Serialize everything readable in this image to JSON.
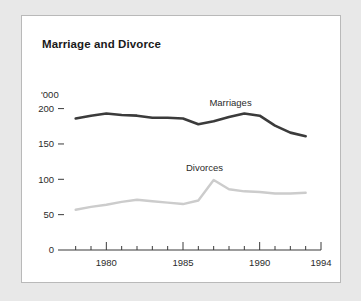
{
  "figure": {
    "title": "Marriage and Divorce",
    "background_color": "#e8e8e8",
    "panel_color": "#ffffff",
    "border_color": "#b9b9b9"
  },
  "chart_data": {
    "type": "line",
    "title": "Marriage and Divorce",
    "xlabel": "",
    "ylabel": "'000",
    "unit_label": "'000",
    "xlim": [
      1977.5,
      1994
    ],
    "ylim": [
      0,
      215
    ],
    "ytick_values": [
      0,
      50,
      100,
      150,
      200
    ],
    "ytick_labels": [
      "0",
      "50",
      "100",
      "150",
      "200"
    ],
    "xtick_values": [
      1978,
      1979,
      1980,
      1981,
      1982,
      1983,
      1984,
      1985,
      1986,
      1987,
      1988,
      1989,
      1990,
      1991,
      1992,
      1993,
      1994
    ],
    "xtick_major": [
      1980,
      1985,
      1990,
      1994
    ],
    "xtick_labels": [
      "1980",
      "1985",
      "1990",
      "1994"
    ],
    "grid": false,
    "legend": "inline-labels",
    "x": [
      1978,
      1979,
      1980,
      1981,
      1982,
      1983,
      1984,
      1985,
      1986,
      1987,
      1988,
      1989,
      1990,
      1991,
      1992,
      1993
    ],
    "series": [
      {
        "name": "Marriages",
        "color": "#3b3b3b",
        "label_x": 1988.1,
        "label_y": 203,
        "values": [
          186,
          190,
          193,
          191,
          190,
          187,
          187,
          186,
          178,
          182,
          188,
          193,
          190,
          176,
          166,
          161
        ]
      },
      {
        "name": "Divorces",
        "color": "#cccccc",
        "label_x": 1986.4,
        "label_y": 112,
        "values": [
          57,
          61,
          64,
          68,
          71,
          69,
          67,
          65,
          70,
          99,
          86,
          83,
          82,
          80,
          80,
          81
        ]
      }
    ]
  }
}
